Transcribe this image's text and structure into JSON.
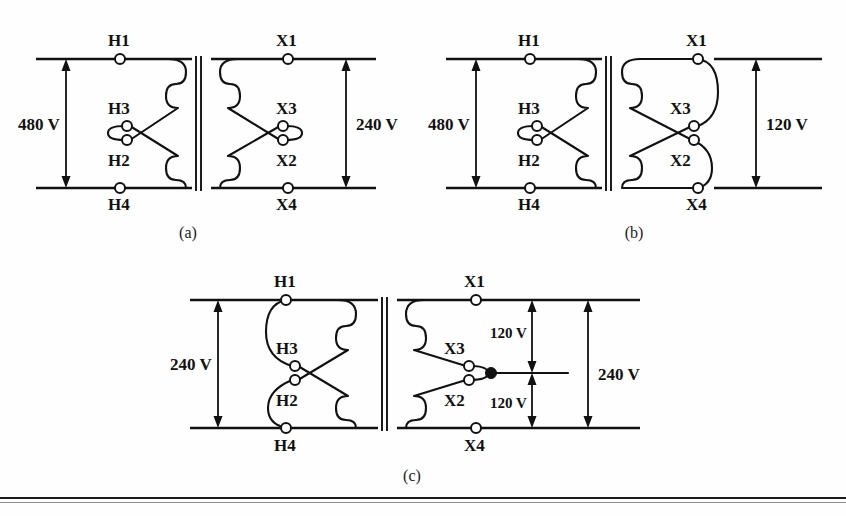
{
  "figure": {
    "background_color": "#fefefe",
    "ink_color": "#111111"
  },
  "diagrams": [
    {
      "id": "a",
      "caption": "(a)",
      "primary": {
        "connection": "parallel",
        "voltage_label": "480 V",
        "terminals": [
          "H1",
          "H3",
          "H2",
          "H4"
        ],
        "terminal_top": "H1",
        "terminal_mid_upper": "H3",
        "terminal_mid_lower": "H2",
        "terminal_bottom": "H4"
      },
      "secondary": {
        "connection": "parallel",
        "voltage_label": "240 V",
        "terminals": [
          "X1",
          "X3",
          "X2",
          "X4"
        ],
        "terminal_top": "X1",
        "terminal_mid_upper": "X3",
        "terminal_mid_lower": "X2",
        "terminal_bottom": "X4"
      }
    },
    {
      "id": "b",
      "caption": "(b)",
      "primary": {
        "connection": "parallel",
        "voltage_label": "480 V",
        "terminals": [
          "H1",
          "H3",
          "H2",
          "H4"
        ],
        "terminal_top": "H1",
        "terminal_mid_upper": "H3",
        "terminal_mid_lower": "H2",
        "terminal_bottom": "H4"
      },
      "secondary": {
        "connection": "parallel-separate",
        "voltage_label": "120 V",
        "terminals": [
          "X1",
          "X3",
          "X2",
          "X4"
        ],
        "terminal_top": "X1",
        "terminal_mid_upper": "X3",
        "terminal_mid_lower": "X2",
        "terminal_bottom": "X4"
      }
    },
    {
      "id": "c",
      "caption": "(c)",
      "primary": {
        "connection": "series",
        "voltage_label": "240 V",
        "terminals": [
          "H1",
          "H3",
          "H2",
          "H4"
        ],
        "terminal_top": "H1",
        "terminal_mid_upper": "H3",
        "terminal_mid_lower": "H2",
        "terminal_bottom": "H4"
      },
      "secondary": {
        "connection": "series-center-tap",
        "voltage_label_total": "240 V",
        "voltage_label_upper": "120 V",
        "voltage_label_lower": "120 V",
        "terminals": [
          "X1",
          "X3",
          "X2",
          "X4"
        ],
        "terminal_top": "X1",
        "terminal_mid_upper": "X3",
        "terminal_mid_lower": "X2",
        "terminal_bottom": "X4",
        "center_tap": true
      }
    }
  ]
}
